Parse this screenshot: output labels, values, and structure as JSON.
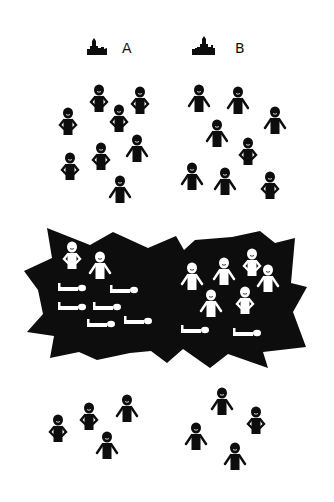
{
  "canvas": {
    "width": 334,
    "height": 502,
    "background": "#ffffff",
    "ink": "#0d0d0d"
  },
  "groups": [
    {
      "id": "A",
      "label": "A",
      "icon": "castle-icon",
      "label_pos": [
        130,
        52
      ],
      "icon_pos": [
        87,
        36
      ],
      "people_before": [
        {
          "x": 99,
          "y": 90,
          "pose": "hands-on-hips"
        },
        {
          "x": 140,
          "y": 92,
          "pose": "hands-on-hips"
        },
        {
          "x": 68,
          "y": 113,
          "pose": "hands-on-hips"
        },
        {
          "x": 119,
          "y": 110,
          "pose": "hands-on-hips"
        },
        {
          "x": 137,
          "y": 140,
          "pose": "arms-out"
        },
        {
          "x": 70,
          "y": 158,
          "pose": "hands-on-hips"
        },
        {
          "x": 101,
          "y": 148,
          "pose": "hands-on-hips"
        },
        {
          "x": 120,
          "y": 181,
          "pose": "arms-out"
        }
      ],
      "people_in_conflict_standing": [
        {
          "x": 72,
          "y": 247,
          "pose": "hands-on-hips"
        },
        {
          "x": 100,
          "y": 257,
          "pose": "arms-out"
        }
      ],
      "people_in_conflict_fallen": [
        {
          "x": 58,
          "y": 287
        },
        {
          "x": 110,
          "y": 289
        },
        {
          "x": 58,
          "y": 306
        },
        {
          "x": 93,
          "y": 306
        },
        {
          "x": 87,
          "y": 323
        },
        {
          "x": 124,
          "y": 320
        }
      ],
      "people_after": [
        {
          "x": 58,
          "y": 420,
          "pose": "hands-on-hips"
        },
        {
          "x": 89,
          "y": 408,
          "pose": "hands-on-hips"
        },
        {
          "x": 127,
          "y": 400,
          "pose": "arms-out"
        },
        {
          "x": 107,
          "y": 437,
          "pose": "arms-out"
        }
      ],
      "counts": {
        "before": 8,
        "survivors": 4,
        "fallen": 6
      }
    },
    {
      "id": "B",
      "label": "B",
      "icon": "castle-icon",
      "label_pos": [
        238,
        52
      ],
      "icon_pos": [
        192,
        36
      ],
      "people_before": [
        {
          "x": 199,
          "y": 90,
          "pose": "arms-out"
        },
        {
          "x": 238,
          "y": 92,
          "pose": "arms-out"
        },
        {
          "x": 275,
          "y": 112,
          "pose": "arms-out"
        },
        {
          "x": 217,
          "y": 125,
          "pose": "arms-out"
        },
        {
          "x": 248,
          "y": 143,
          "pose": "hands-on-hips"
        },
        {
          "x": 192,
          "y": 168,
          "pose": "arms-out"
        },
        {
          "x": 225,
          "y": 173,
          "pose": "arms-out"
        },
        {
          "x": 270,
          "y": 177,
          "pose": "hands-on-hips"
        }
      ],
      "people_in_conflict_standing": [
        {
          "x": 192,
          "y": 268,
          "pose": "arms-out"
        },
        {
          "x": 224,
          "y": 263,
          "pose": "arms-out"
        },
        {
          "x": 252,
          "y": 254,
          "pose": "hands-on-hips"
        },
        {
          "x": 268,
          "y": 270,
          "pose": "arms-out"
        },
        {
          "x": 211,
          "y": 295,
          "pose": "arms-out"
        },
        {
          "x": 245,
          "y": 292,
          "pose": "hands-on-hips"
        }
      ],
      "people_in_conflict_fallen": [
        {
          "x": 181,
          "y": 329
        },
        {
          "x": 233,
          "y": 332
        }
      ],
      "people_after": [
        {
          "x": 222,
          "y": 393,
          "pose": "arms-out"
        },
        {
          "x": 256,
          "y": 412,
          "pose": "hands-on-hips"
        },
        {
          "x": 196,
          "y": 428,
          "pose": "arms-out"
        },
        {
          "x": 235,
          "y": 448,
          "pose": "arms-out"
        }
      ],
      "counts": {
        "before": 8,
        "survivors": 4,
        "fallen": 2
      }
    }
  ],
  "conflict_zone": {
    "shape": "starburst",
    "fill": "#0d0d0d",
    "figure_color": "#ffffff",
    "points": [
      [
        47,
        228
      ],
      [
        90,
        245
      ],
      [
        113,
        232
      ],
      [
        148,
        248
      ],
      [
        176,
        236
      ],
      [
        184,
        250
      ],
      [
        195,
        240
      ],
      [
        232,
        237
      ],
      [
        260,
        231
      ],
      [
        275,
        243
      ],
      [
        295,
        238
      ],
      [
        291,
        283
      ],
      [
        307,
        287
      ],
      [
        293,
        312
      ],
      [
        306,
        347
      ],
      [
        263,
        352
      ],
      [
        268,
        368
      ],
      [
        228,
        354
      ],
      [
        210,
        368
      ],
      [
        183,
        349
      ],
      [
        167,
        363
      ],
      [
        151,
        351
      ],
      [
        130,
        353
      ],
      [
        97,
        360
      ],
      [
        79,
        352
      ],
      [
        50,
        358
      ],
      [
        54,
        336
      ],
      [
        27,
        332
      ],
      [
        43,
        314
      ],
      [
        38,
        290
      ],
      [
        24,
        271
      ],
      [
        52,
        258
      ]
    ]
  },
  "labels": {
    "group_a": "A",
    "group_b": "B"
  }
}
